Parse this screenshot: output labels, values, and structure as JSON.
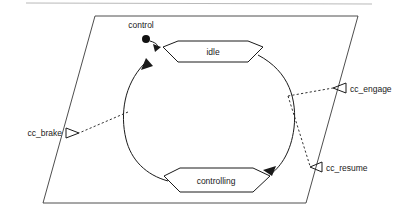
{
  "diagram": {
    "type": "statechart",
    "title": "control",
    "region_name": "control",
    "initial_state_icon": "filled-initial-state-dot",
    "states": [
      {
        "id": "idle",
        "label": "idle",
        "shape": "hexagon-state",
        "position": "top"
      },
      {
        "id": "controlling",
        "label": "controlling",
        "shape": "hexagon-state",
        "position": "bottom"
      }
    ],
    "transitions": [
      {
        "id": "initial-to-idle",
        "from": "initial",
        "to": "idle",
        "style": "solid-arrow"
      },
      {
        "id": "idle-to-controlling",
        "from": "idle",
        "to": "controlling",
        "style": "solid-curved-arrow",
        "side": "right"
      },
      {
        "id": "controlling-to-idle",
        "from": "controlling",
        "to": "idle",
        "style": "solid-curved-arrow",
        "side": "left"
      }
    ],
    "ports": [
      {
        "id": "cc_brake",
        "label": "cc_brake",
        "side": "left",
        "arrow": "open-arrowhead-right",
        "connector": "dashed"
      },
      {
        "id": "cc_engage",
        "label": "cc_engage",
        "side": "right",
        "arrow": "open-arrowhead-left",
        "connector": "dashed"
      },
      {
        "id": "cc_resume",
        "label": "cc_resume",
        "side": "right",
        "arrow": "open-arrowhead-left",
        "connector": "dashed"
      }
    ],
    "boundary": {
      "name": "region-parallelogram",
      "shape": "parallelogram"
    },
    "colors": {
      "stroke": "#1a1a1a",
      "region_stroke": "#3a3a3a",
      "fill": "#ffffff",
      "artifact": "#b9b9b9"
    }
  }
}
